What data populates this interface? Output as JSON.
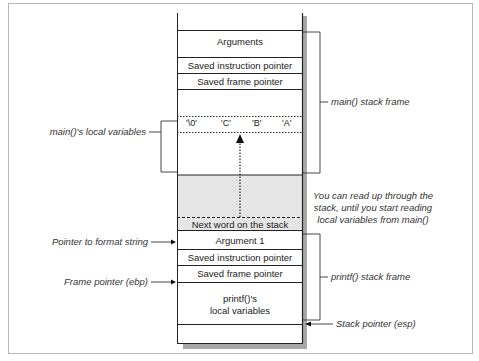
{
  "diagram": {
    "type": "stack-frame-diagram",
    "stack_cells": {
      "arguments": "Arguments",
      "main_saved_ip": "Saved instruction pointer",
      "main_saved_fp": "Saved frame pointer",
      "local_bytes": [
        "'\\0'",
        "'C'",
        "'B'",
        "'A'"
      ],
      "next_word": "Next word on the stack",
      "argument1": "Argument 1",
      "printf_saved_ip": "Saved instruction pointer",
      "printf_saved_fp": "Saved frame pointer",
      "printf_locals_line1": "printf()'s",
      "printf_locals_line2": "local variables"
    },
    "labels": {
      "main_stack_frame": "main() stack frame",
      "main_locals": "main()'s local variables",
      "read_note_line1": "You can read up through the",
      "read_note_line2": "stack, until you start reading",
      "read_note_line3": "local variables from main()",
      "pointer_to_format": "Pointer to format string",
      "frame_pointer": "Frame pointer (ebp)",
      "printf_stack_frame": "printf() stack frame",
      "stack_pointer": "Stack pointer (esp)"
    },
    "colors": {
      "line": "#222222",
      "shaded_region": "#e6e6e6",
      "shadow": "#9a9a9a",
      "border": "#b8b8b8"
    }
  }
}
